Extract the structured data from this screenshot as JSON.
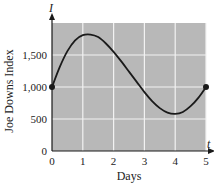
{
  "chart_data": {
    "type": "line",
    "title": "",
    "xlabel": "Days",
    "ylabel": "Joe Downs Index",
    "x_axis_var": "t",
    "y_axis_var": "I",
    "xlim": [
      0,
      5
    ],
    "ylim": [
      0,
      2000
    ],
    "xticks": [
      "0",
      "1",
      "2",
      "3",
      "4",
      "5"
    ],
    "yticks": [
      "0",
      "500",
      "1,000",
      "1,500"
    ],
    "grid": true,
    "legend": null,
    "series": [
      {
        "name": "I(t)",
        "x": [
          0,
          0.25,
          0.5,
          0.75,
          1.0,
          1.25,
          1.5,
          1.75,
          2.0,
          2.25,
          2.5,
          2.75,
          3.0,
          3.25,
          3.5,
          3.75,
          4.0,
          4.25,
          4.5,
          4.75,
          5.0
        ],
        "y": [
          1000,
          1310,
          1560,
          1730,
          1810,
          1820,
          1780,
          1680,
          1550,
          1400,
          1240,
          1080,
          920,
          780,
          670,
          600,
          580,
          610,
          700,
          830,
          1000
        ]
      }
    ],
    "annotations": [
      {
        "type": "endpoint-dot",
        "x": 0,
        "y": 1000
      },
      {
        "type": "endpoint-dot",
        "x": 5,
        "y": 1000
      }
    ]
  },
  "colors": {
    "plot_background": "#b8b8b8",
    "gridline": "#f2f2f2",
    "curve": "#1a1a1a",
    "axis": "#1a1a1a"
  }
}
